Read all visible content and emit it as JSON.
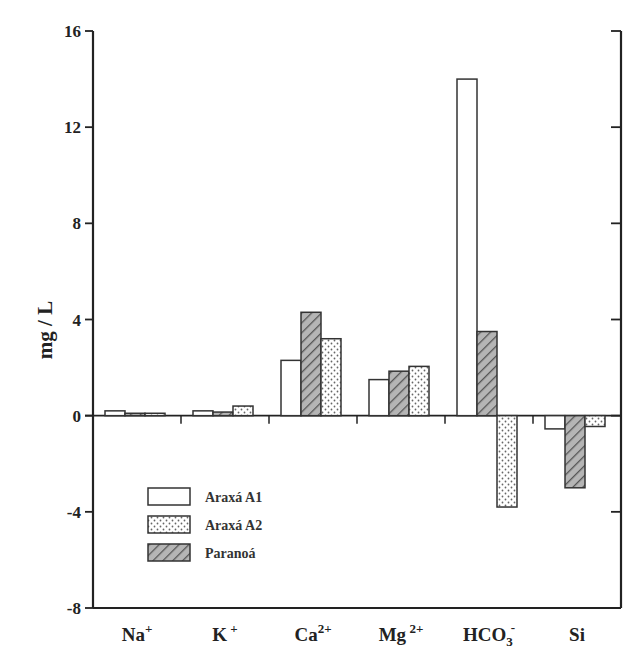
{
  "chart_data": {
    "type": "bar",
    "title": "",
    "xlabel": "",
    "ylabel": "mg / L",
    "ylim": [
      -8,
      16
    ],
    "yticks": [
      16,
      12,
      8,
      4,
      0,
      -4,
      -8
    ],
    "grid": false,
    "legend_position": "lower-left inside plot",
    "categories": [
      "Na+",
      "K+",
      "Ca2+",
      "Mg2+",
      "HCO3-",
      "Si"
    ],
    "category_display": [
      {
        "base": "Na",
        "sup": "+",
        "sub": ""
      },
      {
        "base": "K",
        "sup": " +",
        "sub": ""
      },
      {
        "base": "Ca",
        "sup": "2+",
        "sub": ""
      },
      {
        "base": "Mg",
        "sup": " 2+",
        "sub": ""
      },
      {
        "base": "HCO",
        "sup": "-",
        "sub": "3"
      },
      {
        "base": "Si",
        "sup": "",
        "sub": ""
      }
    ],
    "series": [
      {
        "name": "Araxá A1",
        "pattern": "open",
        "values": [
          0.2,
          0.2,
          2.3,
          1.5,
          14.0,
          -0.55
        ]
      },
      {
        "name": "Paranoá",
        "pattern": "hatched",
        "values": [
          0.1,
          0.15,
          4.3,
          1.85,
          3.5,
          -3.0
        ]
      },
      {
        "name": "Araxá A2",
        "pattern": "dotted",
        "values": [
          0.1,
          0.4,
          3.2,
          2.05,
          -3.8,
          -0.45
        ]
      }
    ],
    "legend": [
      {
        "label": "Araxá A1",
        "pattern": "open"
      },
      {
        "label": "Araxá A2",
        "pattern": "dotted"
      },
      {
        "label": "Paranoá",
        "pattern": "hatched"
      }
    ]
  },
  "colors": {
    "axis": "#222222",
    "bar_outline": "#333333",
    "hatch_fill": "#9a9a9a",
    "dot": "#666666"
  }
}
